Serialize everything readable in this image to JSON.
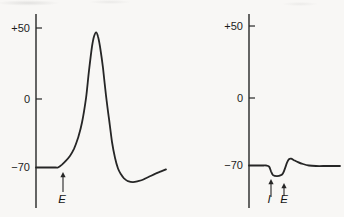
{
  "figure": {
    "background": "#f6f5f2",
    "ink": "#262626",
    "description_labels": {
      "excitatory": "E",
      "inhibitory": "I"
    }
  },
  "chart_data": [
    {
      "type": "line",
      "id": "action-potential-trace",
      "title": "",
      "xlabel": "",
      "ylabel": "",
      "x_axis_visible": false,
      "grid": false,
      "ylim": [
        -90,
        55
      ],
      "y_ticks": [
        {
          "label": "+50",
          "value": 50,
          "frac": 0.0722,
          "tick": true
        },
        {
          "label": "0",
          "value": 0,
          "frac": 0.4381,
          "tick": true
        },
        {
          "label": "−70",
          "value": -70,
          "frac": 0.7912,
          "tick": false
        }
      ],
      "points": [
        [
          0,
          -70
        ],
        [
          0.09,
          -70
        ],
        [
          0.15,
          -70
        ],
        [
          0.169,
          -70
        ],
        [
          0.2,
          -67
        ],
        [
          0.231,
          -63
        ],
        [
          0.262,
          -58
        ],
        [
          0.292,
          -51
        ],
        [
          0.323,
          -40
        ],
        [
          0.354,
          -24
        ],
        [
          0.385,
          1
        ],
        [
          0.408,
          20
        ],
        [
          0.431,
          37
        ],
        [
          0.446,
          44
        ],
        [
          0.462,
          47
        ],
        [
          0.477,
          44
        ],
        [
          0.492,
          37
        ],
        [
          0.515,
          22
        ],
        [
          0.538,
          3
        ],
        [
          0.562,
          -21
        ],
        [
          0.585,
          -44
        ],
        [
          0.608,
          -60
        ],
        [
          0.631,
          -71
        ],
        [
          0.654,
          -77
        ],
        [
          0.677,
          -81
        ],
        [
          0.708,
          -84
        ],
        [
          0.746,
          -85
        ],
        [
          0.785,
          -84
        ],
        [
          0.831,
          -82
        ],
        [
          0.877,
          -79
        ],
        [
          0.923,
          -76
        ],
        [
          0.962,
          -74
        ],
        [
          1,
          -72
        ]
      ],
      "annotations": [
        {
          "label": "E",
          "x": 63,
          "tip_y": 172,
          "tail_y": 192,
          "label_y": 203,
          "label_dx": -1
        }
      ],
      "layout": {
        "axis_x": 36,
        "axis_top": 14,
        "axis_bottom": 208,
        "trace_x0": 36,
        "trace_x1": 166,
        "tick_len": 6
      }
    },
    {
      "type": "line",
      "id": "ipsp-epsp-trace",
      "title": "",
      "xlabel": "",
      "ylabel": "",
      "x_axis_visible": false,
      "grid": false,
      "ylim": [
        -90,
        55
      ],
      "y_ticks": [
        {
          "label": "+50",
          "value": 50,
          "frac": 0.0619,
          "tick": true
        },
        {
          "label": "0",
          "value": 0,
          "frac": 0.433,
          "tick": true
        },
        {
          "label": "−70",
          "value": -70,
          "frac": 0.7809,
          "tick": false
        }
      ],
      "points": [
        [
          0,
          -70
        ],
        [
          0.1,
          -70
        ],
        [
          0.16,
          -70
        ],
        [
          0.187,
          -70
        ],
        [
          0.22,
          -71
        ],
        [
          0.242,
          -76
        ],
        [
          0.264,
          -80
        ],
        [
          0.308,
          -81
        ],
        [
          0.352,
          -80
        ],
        [
          0.374,
          -78
        ],
        [
          0.396,
          -73
        ],
        [
          0.418,
          -67
        ],
        [
          0.44,
          -63.5
        ],
        [
          0.462,
          -63
        ],
        [
          0.495,
          -64.5
        ],
        [
          0.538,
          -66.5
        ],
        [
          0.593,
          -68.5
        ],
        [
          0.659,
          -70
        ],
        [
          0.736,
          -70.5
        ],
        [
          0.846,
          -70.5
        ],
        [
          0.9,
          -70.5
        ],
        [
          1,
          -70.5
        ]
      ],
      "annotations": [
        {
          "label": "I",
          "x": 271,
          "tip_y": 179,
          "tail_y": 197,
          "label_y": 203,
          "label_dx": -2
        },
        {
          "label": "E",
          "x": 284,
          "tip_y": 183,
          "tail_y": 196,
          "label_y": 203,
          "label_dx": 0
        }
      ],
      "layout": {
        "axis_x": 249,
        "axis_top": 14,
        "axis_bottom": 208,
        "trace_x0": 249,
        "trace_x1": 340,
        "tick_len": 6
      }
    }
  ]
}
